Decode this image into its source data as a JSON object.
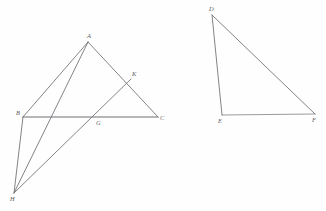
{
  "figure": {
    "title_artifact": "",
    "background_color": "#fefefe",
    "stroke_color": "#6e6e73",
    "label_color": "#5e5e62",
    "left_diagram": {
      "name": "triangle-abc-with-cevians",
      "points": {
        "A": {
          "label": "A",
          "x": 88,
          "y": 42
        },
        "B": {
          "label": "B",
          "x": 23,
          "y": 117
        },
        "C": {
          "label": "C",
          "x": 158,
          "y": 117
        },
        "K": {
          "label": "K",
          "x": 131,
          "y": 79
        },
        "G": {
          "label": "G",
          "x": 98,
          "y": 117
        },
        "H": {
          "label": "H",
          "x": 14,
          "y": 193
        }
      },
      "segments": [
        {
          "name": "segment-AB",
          "from": "A",
          "to": "B"
        },
        {
          "name": "segment-AC",
          "from": "A",
          "to": "C"
        },
        {
          "name": "segment-BC",
          "from": "B",
          "to": "C"
        },
        {
          "name": "segment-AH",
          "from": "A",
          "to": "H"
        },
        {
          "name": "segment-BH",
          "from": "B",
          "to": "H"
        },
        {
          "name": "segment-KH",
          "from": "K",
          "to": "H"
        }
      ]
    },
    "right_diagram": {
      "name": "triangle-def",
      "points": {
        "D": {
          "label": "D",
          "x": 212,
          "y": 15
        },
        "E": {
          "label": "E",
          "x": 222,
          "y": 115
        },
        "F": {
          "label": "F",
          "x": 315,
          "y": 114
        }
      },
      "segments": [
        {
          "name": "segment-DE",
          "from": "D",
          "to": "E"
        },
        {
          "name": "segment-DF",
          "from": "D",
          "to": "F"
        },
        {
          "name": "segment-EF",
          "from": "E",
          "to": "F"
        }
      ]
    }
  },
  "labels": {
    "A": "A",
    "B": "B",
    "C": "C",
    "K": "K",
    "G": "G",
    "H": "H",
    "D": "D",
    "E": "E",
    "F": "F"
  }
}
